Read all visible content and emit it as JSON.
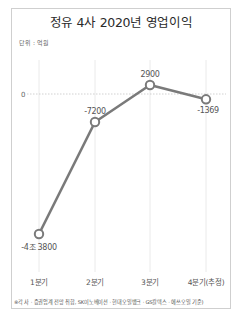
{
  "chart_data": {
    "type": "line",
    "title": "정유 4사 2020년 영업이익",
    "unit_label": "단위 : 억원",
    "xlabel": "",
    "ylabel": "",
    "categories": [
      "1분기",
      "2분기",
      "3분기",
      "4분기(추정)"
    ],
    "series": [
      {
        "name": "영업이익",
        "values": [
          -43800,
          -7200,
          2900,
          -1369
        ],
        "data_labels": [
          "-4조 3800",
          "-7200",
          "2900",
          "-1369"
        ]
      }
    ],
    "reference_line": {
      "value": 0,
      "label": "0",
      "style": "dashed"
    },
    "grid": {
      "vertical": true,
      "horizontal": false
    },
    "legend": "none",
    "line_color": "#7a7a7a",
    "footnote": "※각 사 · 증권업계 전망 취합, SK이노베이션 · 현대오일뱅크 · GS칼텍스 · 에쓰오일 기준)"
  }
}
